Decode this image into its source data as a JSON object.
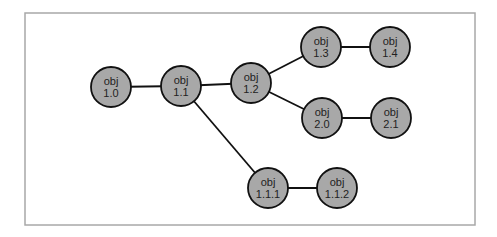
{
  "diagram": {
    "frame": {
      "x": 25,
      "y": 13,
      "width": 450,
      "height": 212,
      "stroke": "#a8a8a8"
    },
    "node_style": {
      "radius": 20,
      "fill": "#a8a8a8",
      "stroke": "#111111"
    },
    "edge_color": "#111111",
    "nodes": [
      {
        "id": "1.0",
        "line1": "obj",
        "line2": "1.0",
        "x": 111,
        "y": 87
      },
      {
        "id": "1.1",
        "line1": "obj",
        "line2": "1.1",
        "x": 181,
        "y": 86
      },
      {
        "id": "1.2",
        "line1": "obj",
        "line2": "1.2",
        "x": 251,
        "y": 83
      },
      {
        "id": "1.3",
        "line1": "obj",
        "line2": "1.3",
        "x": 321,
        "y": 47
      },
      {
        "id": "1.4",
        "line1": "obj",
        "line2": "1.4",
        "x": 390,
        "y": 47
      },
      {
        "id": "2.0",
        "line1": "obj",
        "line2": "2.0",
        "x": 322,
        "y": 118
      },
      {
        "id": "2.1",
        "line1": "obj",
        "line2": "2.1",
        "x": 391,
        "y": 118
      },
      {
        "id": "1.1.1",
        "line1": "obj",
        "line2": "1.1.1",
        "x": 268,
        "y": 188
      },
      {
        "id": "1.1.2",
        "line1": "obj",
        "line2": "1.1.2",
        "x": 337,
        "y": 188
      }
    ],
    "edges": [
      [
        "1.0",
        "1.1"
      ],
      [
        "1.1",
        "1.2"
      ],
      [
        "1.2",
        "1.3"
      ],
      [
        "1.3",
        "1.4"
      ],
      [
        "1.2",
        "2.0"
      ],
      [
        "2.0",
        "2.1"
      ],
      [
        "1.1",
        "1.1.1"
      ],
      [
        "1.1.1",
        "1.1.2"
      ]
    ]
  }
}
